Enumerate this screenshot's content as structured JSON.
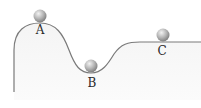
{
  "diagram": {
    "title": "",
    "colors": {
      "track_stroke": "#7a7a7a",
      "track_fill": "#f3f3f3",
      "ball_light": "#e6e6e6",
      "ball_dark": "#8a8a8a",
      "label": "#2a2a2a"
    },
    "balls": [
      {
        "id": "A",
        "label": "A",
        "cx": 40,
        "cy": 16,
        "r": 6.5,
        "position": "hilltop"
      },
      {
        "id": "B",
        "label": "B",
        "cx": 91,
        "cy": 66,
        "r": 6.5,
        "position": "valley bottom"
      },
      {
        "id": "C",
        "label": "C",
        "cx": 163,
        "cy": 35,
        "r": 6.5,
        "position": "flat plateau"
      }
    ],
    "labels": {
      "A": "A",
      "B": "B",
      "C": "C"
    }
  }
}
